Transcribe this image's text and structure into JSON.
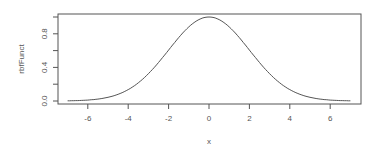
{
  "chart_data": {
    "type": "line",
    "title": "",
    "xlabel": "x",
    "ylabel": "rbfFunct",
    "xlim": [
      -7,
      7
    ],
    "ylim": [
      0,
      1
    ],
    "x_ticks": [
      -6,
      -4,
      -2,
      0,
      2,
      4,
      6
    ],
    "x_tick_labels": [
      "-6",
      "-4",
      "-2",
      "0",
      "2",
      "4",
      "6"
    ],
    "y_ticks": [
      0.0,
      0.2,
      0.4,
      0.6,
      0.8,
      1.0
    ],
    "y_tick_labels": [
      "0.0",
      "",
      "0.4",
      "",
      "0.8",
      ""
    ],
    "grid": false,
    "legend": null,
    "series": [
      {
        "name": "rbfFunct",
        "description": "Gaussian radial basis function, approx exp(-x^2/8)",
        "x": [
          -7,
          -6,
          -5,
          -4,
          -3,
          -2,
          -1,
          0,
          1,
          2,
          3,
          4,
          5,
          6,
          7
        ],
        "y": [
          0.002,
          0.011,
          0.044,
          0.135,
          0.325,
          0.607,
          0.882,
          1.0,
          0.882,
          0.607,
          0.325,
          0.135,
          0.044,
          0.011,
          0.002
        ]
      }
    ]
  },
  "colors": {
    "line": "#555555",
    "axis": "#555555",
    "text": "#555555",
    "background": "#ffffff"
  }
}
